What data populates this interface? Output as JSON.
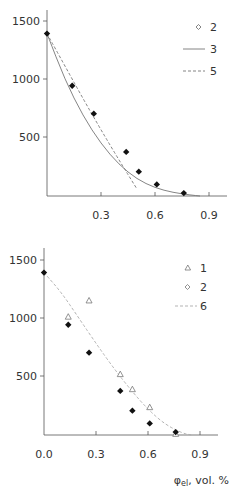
{
  "chart_data": [
    {
      "type": "scatter",
      "title": "",
      "xlabel": "",
      "ylabel": "",
      "xlim": [
        0,
        1.0
      ],
      "ylim": [
        0,
        1600
      ],
      "x_ticks": [
        0.3,
        0.6,
        0.9
      ],
      "x_tick_labels": [
        "0.3",
        "0.6",
        "0.9"
      ],
      "y_ticks": [
        500,
        1000,
        1500
      ],
      "y_tick_labels": [
        "500",
        "1000",
        "1500"
      ],
      "grid": false,
      "legend_position": "upper right",
      "legend": [
        {
          "label": "2",
          "style": "diamond-marker"
        },
        {
          "label": "3",
          "style": "solid-line"
        },
        {
          "label": "5",
          "style": "dashed-line"
        }
      ],
      "series": [
        {
          "name": "2",
          "kind": "points",
          "marker": "filled-diamond",
          "x": [
            0.0,
            0.14,
            0.26,
            0.44,
            0.51,
            0.61,
            0.76
          ],
          "y": [
            1400,
            950,
            710,
            380,
            210,
            100,
            25
          ]
        },
        {
          "name": "3",
          "kind": "line",
          "style": "solid",
          "x": [
            0.0,
            0.1,
            0.2,
            0.3,
            0.4,
            0.5,
            0.6,
            0.7,
            0.8,
            0.85
          ],
          "y": [
            1400,
            1000,
            690,
            450,
            270,
            145,
            70,
            30,
            8,
            0
          ]
        },
        {
          "name": "5",
          "kind": "line",
          "style": "dashed",
          "x": [
            0.0,
            0.1,
            0.2,
            0.3,
            0.4,
            0.5
          ],
          "y": [
            1400,
            1120,
            840,
            570,
            310,
            60
          ]
        }
      ]
    },
    {
      "type": "scatter",
      "title": "",
      "xlabel": "φel, vol. %",
      "ylabel": "",
      "xlim": [
        0,
        1.0
      ],
      "ylim": [
        0,
        1600
      ],
      "x_ticks": [
        0.0,
        0.3,
        0.6,
        0.9
      ],
      "x_tick_labels": [
        "0.0",
        "0.3",
        "0.6",
        "0.9"
      ],
      "y_ticks": [
        500,
        1000,
        1500
      ],
      "y_tick_labels": [
        "500",
        "1000",
        "1500"
      ],
      "grid": false,
      "legend_position": "upper right",
      "legend": [
        {
          "label": "1",
          "style": "triangle-marker"
        },
        {
          "label": "2",
          "style": "diamond-marker"
        },
        {
          "label": "6",
          "style": "dashed-line"
        }
      ],
      "series": [
        {
          "name": "1",
          "kind": "points",
          "marker": "open-triangle",
          "x": [
            0.14,
            0.26,
            0.44,
            0.51,
            0.61,
            0.76
          ],
          "y": [
            1020,
            1160,
            525,
            395,
            240,
            10
          ]
        },
        {
          "name": "2",
          "kind": "points",
          "marker": "filled-diamond",
          "x": [
            0.0,
            0.14,
            0.26,
            0.44,
            0.51,
            0.61,
            0.76
          ],
          "y": [
            1400,
            950,
            710,
            380,
            210,
            100,
            25
          ]
        },
        {
          "name": "6",
          "kind": "line",
          "style": "dashed",
          "x": [
            0.0,
            0.1,
            0.2,
            0.3,
            0.4,
            0.5,
            0.6,
            0.7,
            0.8,
            0.85
          ],
          "y": [
            1400,
            1230,
            1010,
            790,
            580,
            390,
            220,
            90,
            15,
            0
          ]
        }
      ]
    }
  ],
  "panels": {
    "top": {
      "legend_labels": [
        "2",
        "3",
        "5"
      ],
      "x_tick_labels": [
        "0.3",
        "0.6",
        "0.9"
      ],
      "y_tick_labels": [
        "500",
        "1000",
        "1500"
      ]
    },
    "bottom": {
      "legend_labels": [
        "1",
        "2",
        "6"
      ],
      "x_tick_labels": [
        "0.0",
        "0.3",
        "0.6",
        "0.9"
      ],
      "y_tick_labels": [
        "500",
        "1000",
        "1500"
      ],
      "x_axis_title_symbol": "φ",
      "x_axis_title_subscript": "el",
      "x_axis_title_rest": ", vol. %"
    }
  },
  "colors": {
    "axis": "#555555",
    "points": "#111111",
    "line": "#777777",
    "dashed_line_bottom": "#aaaaaa",
    "text": "#333333"
  }
}
